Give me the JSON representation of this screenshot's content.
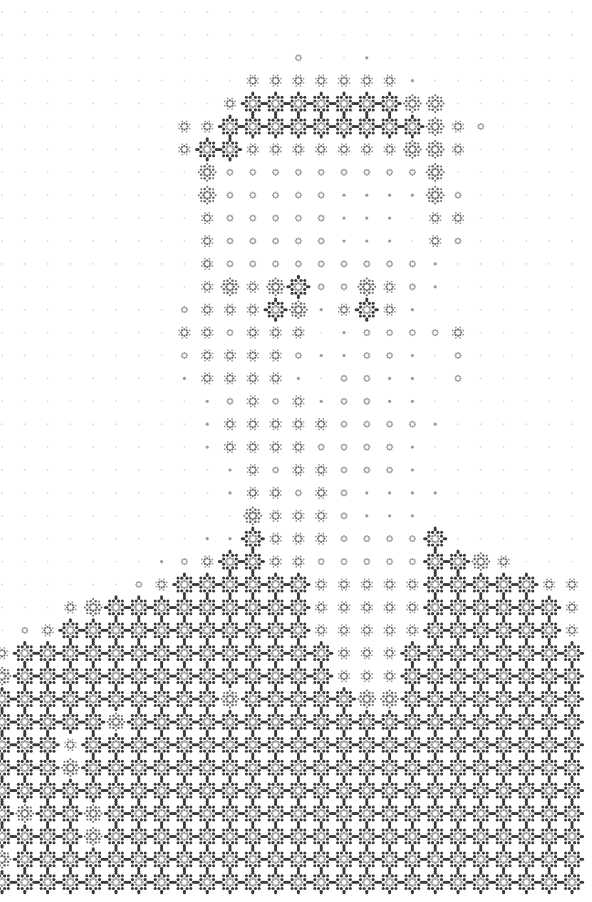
{
  "image": {
    "description": "Halftone portrait of a person (head and shoulders) rendered with a grid of rosette/flower dot glyphs",
    "width": 592,
    "height": 902,
    "background": "#ffffff"
  },
  "grid": {
    "origin_x": 2,
    "origin_y": 12,
    "pitch_x": 22.8,
    "pitch_y": 22.9,
    "cols": 26,
    "rows": 39
  },
  "palette": {
    "dark": "#3a3a3a",
    "mid": "#6a6a6a",
    "light": "#9a9a9a",
    "faint": "#d8d8d8"
  },
  "levels": [
    {
      "id": 0,
      "name": "faint-dot"
    },
    {
      "id": 1,
      "name": "small-dot"
    },
    {
      "id": 2,
      "name": "ring"
    },
    {
      "id": 3,
      "name": "small-rosette"
    },
    {
      "id": 4,
      "name": "medium-rosette"
    },
    {
      "id": 5,
      "name": "large-rosette"
    }
  ],
  "intensity_rows": [
    "00000000000000000000000000",
    "00000000000000000000000000",
    "00000000000002001000000000",
    "00000000000333333310000000",
    "00000000003555555544000000",
    "00000000335555555554320000",
    "00000000355333333344300000",
    "00000000042222222224000000",
    "00000000042222211114200000",
    "00000000032222211103300000",
    "00000000032222211103200000",
    "00000000032222222221000000",
    "00000000034345224321000000",
    "00000000233354135310000000",
    "00000000332333012222300000",
    "00000000233332112210200000",
    "00000000133331022110200000",
    "00000000012323122110000000",
    "00000000013333322221000000",
    "00000000013333222210000000",
    "00000000001323322210000000",
    "00000000001332321111000000",
    "00000000000433321110000000",
    "00000000011533322225000000",
    "00000001235533222225543000",
    "00000023555555333335555533",
    "00034555555555333335555553",
    "02355555555555333335555553",
    "35555555555555533355555555",
    "45555555555555533355555555",
    "55555555554555554455555555",
    "55555455555555555555555555",
    "55535555555555555555555555",
    "55545555555555555555555555",
    "55555555555555555555555555",
    "54554555555555555555555555",
    "55554555555555555555555555",
    "45555555555555555555555555",
    "55555555555555555555555555"
  ]
}
